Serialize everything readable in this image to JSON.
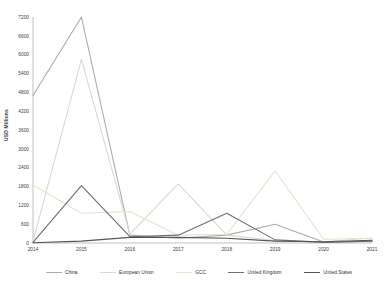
{
  "chart_data": {
    "type": "line",
    "title": "",
    "xlabel": "",
    "ylabel": "USD Millions",
    "categories": [
      "2014",
      "2015",
      "2016",
      "2017",
      "2018",
      "2019",
      "2020",
      "2021"
    ],
    "ylim": [
      0,
      7200
    ],
    "ytick_step": 600,
    "grid": false,
    "legend_position": "bottom",
    "axis_color": "#a6a6a6",
    "tick_text_color": "#3d3d3d",
    "series": [
      {
        "name": "China",
        "color": "#a7b0a6",
        "values": [
          4700,
          7200,
          250,
          150,
          250,
          600,
          30,
          60
        ]
      },
      {
        "name": "European Union",
        "color": "#d4dccf",
        "values": [
          50,
          5850,
          280,
          1880,
          250,
          80,
          40,
          160
        ]
      },
      {
        "name": "GCC",
        "color": "#e8e3cc",
        "values": [
          1850,
          950,
          1000,
          250,
          280,
          2300,
          120,
          150
        ]
      },
      {
        "name": "United Kingdom",
        "color": "#6e6f73",
        "values": [
          20,
          1830,
          200,
          250,
          950,
          100,
          20,
          60
        ]
      },
      {
        "name": "United States",
        "color": "#54555a",
        "values": [
          10,
          60,
          180,
          180,
          150,
          60,
          40,
          90
        ]
      }
    ]
  }
}
